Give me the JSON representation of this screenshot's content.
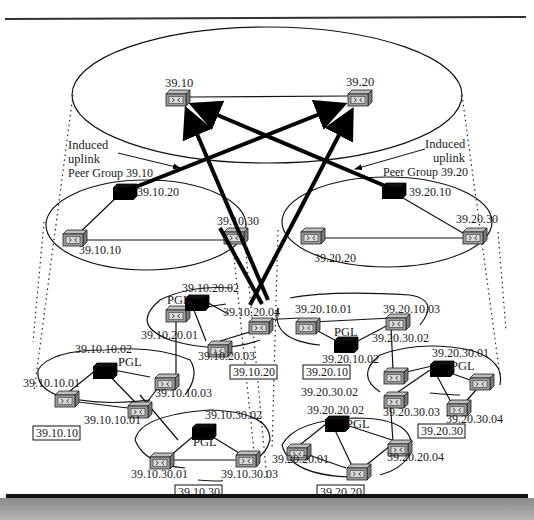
{
  "diagram": {
    "type": "PNNI hierarchical network",
    "top_group": {
      "nodes": [
        {
          "id": "n3910",
          "label": "39.10",
          "x": 168,
          "y": 100,
          "kind": "switch"
        },
        {
          "id": "n3920",
          "label": "39.20",
          "x": 360,
          "y": 98,
          "kind": "switch"
        }
      ]
    },
    "annotations": {
      "left_induced": "Induced",
      "left_uplink": "uplink",
      "left_peer_group": "Peer Group 39.10",
      "right_induced": "Induced",
      "right_uplink": "uplink",
      "right_peer_group": "Peer Group 39.20"
    },
    "peer_group_3910": {
      "nodes": [
        {
          "label": "39.10.20",
          "kind": "pgl"
        },
        {
          "label": "39.10.30",
          "kind": "switch"
        },
        {
          "label": "39.10.10",
          "kind": "switch"
        }
      ]
    },
    "peer_group_3920": {
      "nodes": [
        {
          "label": "39.20.10",
          "kind": "pgl"
        },
        {
          "label": "39.20.30",
          "kind": "switch"
        },
        {
          "label": "39.20.20",
          "kind": "switch"
        }
      ]
    },
    "lowest_groups": [
      {
        "box_label": "39.10.20",
        "pgl_text": "PGL",
        "nodes": [
          "39.10.20.02",
          "39.10.20.01",
          "39.10.20.03",
          "39.10.20.04"
        ]
      },
      {
        "box_label": "39.20.10",
        "pgl_text": "PGL",
        "nodes": [
          "39.20.10.01",
          "39.20.10.03",
          "39.20.10.02"
        ]
      },
      {
        "box_label": "39.10.10",
        "pgl_text": "PGL",
        "nodes": [
          "39.10.10.02",
          "39.10.10.01",
          "39.10.10.03",
          "39.10.10.01"
        ]
      },
      {
        "box_label": "39.20.30",
        "pgl_text": "PGL",
        "nodes": [
          "39.20.30.02",
          "39.20.30.01",
          "39.20.30.03",
          "39.20.30.04"
        ]
      },
      {
        "box_label": "39.10.30",
        "pgl_text": "PGL",
        "nodes": [
          "39.10.30.02",
          "39.10.30.01",
          "39.10.30.03"
        ]
      },
      {
        "box_label": "39.20.20",
        "pgl_text": "PGL",
        "nodes": [
          "39.20.20.02",
          "39.20.20.01",
          "39.20.20.04"
        ]
      }
    ],
    "extra_labels": {
      "l_3920_30_02_a": "39.20.30.02",
      "l_3920_30_02_b": "39.20.30.02"
    }
  }
}
